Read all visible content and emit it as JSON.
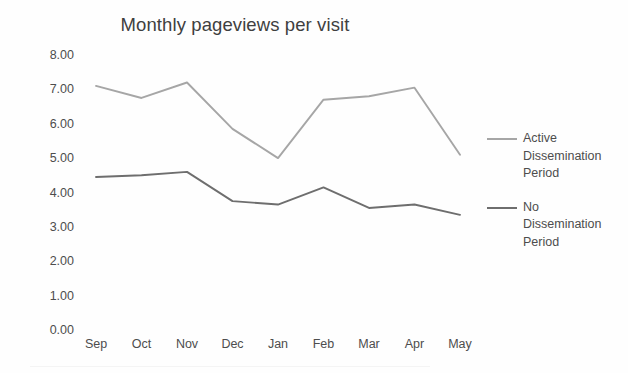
{
  "chart_data": {
    "type": "line",
    "title": "Monthly pageviews per visit",
    "xlabel": "",
    "ylabel": "",
    "categories": [
      "Sep",
      "Oct",
      "Nov",
      "Dec",
      "Jan",
      "Feb",
      "Mar",
      "Apr",
      "May"
    ],
    "series": [
      {
        "name": "Active Dissemination Period",
        "color": "#a6a6a6",
        "values": [
          7.1,
          6.75,
          7.2,
          5.85,
          5.0,
          6.7,
          6.8,
          7.05,
          5.1
        ]
      },
      {
        "name": "No Dissemination Period",
        "color": "#6e6e6e",
        "values": [
          4.45,
          4.5,
          4.6,
          3.75,
          3.65,
          4.15,
          3.55,
          3.65,
          3.35
        ]
      }
    ],
    "ylim": [
      0,
      8
    ],
    "ytick_values": [
      8,
      7,
      6,
      5,
      4,
      3,
      2,
      1,
      0
    ],
    "ytick_labels": [
      "8.00",
      "7.00",
      "6.00",
      "5.00",
      "4.00",
      "3.00",
      "2.00",
      "1.00",
      "0.00"
    ],
    "grid": false,
    "legend_position": "right",
    "legend": [
      "Active Dissemination Period",
      "No Dissemination Period"
    ]
  },
  "legend_entries": [
    {
      "label": "Active Dissemination Period",
      "color": "#a6a6a6"
    },
    {
      "label": "No Dissemination Period",
      "color": "#6e6e6e"
    }
  ],
  "colors": {
    "background": "#fefefe",
    "text": "#4d4d4d",
    "series_active": "#a6a6a6",
    "series_none": "#6e6e6e"
  }
}
